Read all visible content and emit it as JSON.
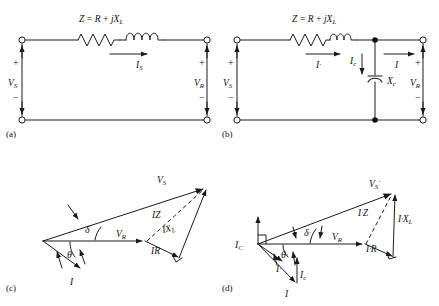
{
  "figure": {
    "background": "#ffffff",
    "stroke": "#1a1a1a",
    "panels": [
      {
        "id": "a",
        "label": "(a)",
        "type": "circuit",
        "caption": "Series circuit without shunt capacitor"
      },
      {
        "id": "b",
        "label": "(b)",
        "type": "circuit",
        "caption": "Series circuit with shunt capacitor"
      },
      {
        "id": "c",
        "label": "(c)",
        "type": "phasor",
        "caption": "Phasor diagram without capacitor"
      },
      {
        "id": "d",
        "label": "(d)",
        "type": "phasor",
        "caption": "Phasor diagram with capacitor"
      }
    ]
  },
  "panel_a": {
    "label": "(a)",
    "impedance_label": {
      "lead": "Z",
      "eq": "=",
      "r": "R",
      "plus": "+",
      "j": "j",
      "x": "X",
      "x_sub": "L"
    },
    "source_label": {
      "main": "V",
      "sub": "S"
    },
    "receiver_label": {
      "main": "V",
      "sub": "R"
    },
    "current_label": {
      "main": "I",
      "sub": "S"
    },
    "plus_sign": "+",
    "minus_sign": "−",
    "elements": [
      "resistor",
      "inductor",
      "source-terminals",
      "load-terminals"
    ]
  },
  "panel_b": {
    "label": "(b)",
    "impedance_label": {
      "lead": "Z",
      "eq": "=",
      "r": "R",
      "plus": "+",
      "j": "j",
      "x": "X",
      "x_sub": "L"
    },
    "source_label": {
      "main": "V",
      "sub": "S"
    },
    "receiver_label": {
      "main": "V",
      "sub": "R"
    },
    "line_current_label": {
      "main": "I",
      "prime": "'"
    },
    "cap_current_label": {
      "main": "I",
      "sub": "c"
    },
    "load_current_label": {
      "main": "I"
    },
    "capacitor_label": {
      "main": "X",
      "sub": "c"
    },
    "plus_sign": "+",
    "minus_sign": "−",
    "elements": [
      "resistor",
      "inductor",
      "capacitor",
      "junction-dots",
      "source-terminals",
      "load-terminals"
    ]
  },
  "panel_c": {
    "label": "(c)",
    "phasors": [
      {
        "name": "V_R",
        "main": "V",
        "sub": "R",
        "kind": "solid"
      },
      {
        "name": "V_S",
        "main": "V",
        "sub": "S",
        "kind": "solid"
      },
      {
        "name": "I",
        "main": "I",
        "sub": "",
        "kind": "solid"
      },
      {
        "name": "IZ",
        "main": "IZ",
        "sub": "",
        "kind": "dashed"
      },
      {
        "name": "IR",
        "main": "IR",
        "sub": "",
        "kind": "solid"
      },
      {
        "name": "IX_L",
        "main": "IX",
        "sub": "L",
        "kind": "solid"
      }
    ],
    "angles": [
      {
        "name": "delta",
        "glyph": "δ"
      },
      {
        "name": "theta",
        "glyph": "θ"
      }
    ]
  },
  "panel_d": {
    "label": "(d)",
    "phasors": [
      {
        "name": "V_R",
        "main": "V",
        "sub": "R",
        "kind": "solid"
      },
      {
        "name": "V_S_prime",
        "main": "V",
        "sub": "S",
        "prime": "'",
        "kind": "solid"
      },
      {
        "name": "I_C",
        "main": "I",
        "sub": "C",
        "kind": "solid"
      },
      {
        "name": "I_prime",
        "main": "I",
        "prime": "'",
        "kind": "solid"
      },
      {
        "name": "I_c",
        "main": "I",
        "sub": "c",
        "kind": "solid"
      },
      {
        "name": "I",
        "main": "I",
        "kind": "solid"
      },
      {
        "name": "I_prime_Z",
        "main": "I",
        "prime": "'",
        "tail": "Z",
        "kind": "dashed"
      },
      {
        "name": "I_prime_R",
        "main": "I",
        "prime": "'",
        "tail": "R",
        "kind": "solid"
      },
      {
        "name": "I_prime_X_L",
        "main": "I",
        "prime": "'",
        "tail": "X",
        "sub": "L",
        "kind": "solid"
      }
    ],
    "angles": [
      {
        "name": "delta-prime",
        "glyph": "δ",
        "prime": "'"
      },
      {
        "name": "theta-prime",
        "glyph": "θ",
        "prime": "'"
      }
    ],
    "right_angle_marker": true
  }
}
